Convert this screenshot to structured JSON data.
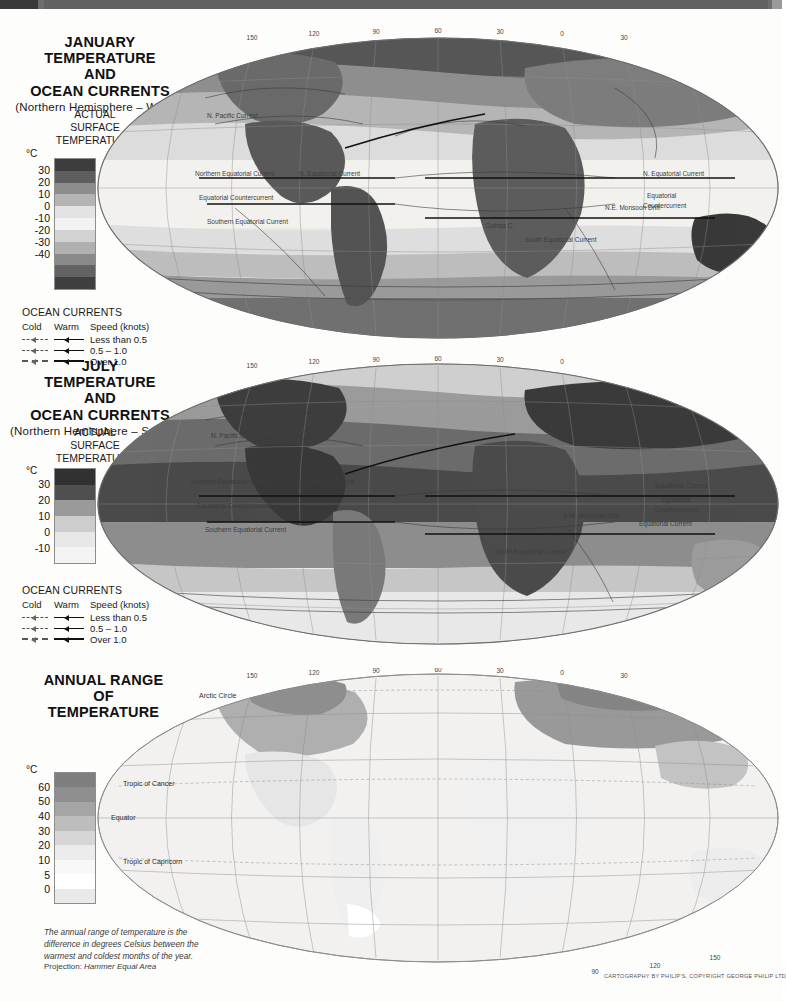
{
  "page": {
    "projection_label": "Projection:",
    "projection_value": "Hammer Equal Area",
    "credit": "CARTOGRAPHY BY PHILIP'S, COPYRIGHT GEORGE PHILIP LTD"
  },
  "maps": [
    {
      "id": "january",
      "title_lines": [
        "JANUARY",
        "TEMPERATURE",
        "AND",
        "OCEAN CURRENTS"
      ],
      "subtitle": "(Northern Hemisphere – Winter)",
      "legend_heading": [
        "ACTUAL",
        "SURFACE",
        "TEMPERATURE"
      ],
      "unit": "°C",
      "scale_values": [
        "30",
        "20",
        "10",
        "0",
        "-10",
        "-20",
        "-30",
        "-40"
      ],
      "swatch_colors": [
        "#3d3d3d",
        "#5e5e5e",
        "#8d8d8d",
        "#b4b4b4",
        "#e3e3e3",
        "#f2f2f2",
        "#d2d2d2",
        "#b0b0b0",
        "#8a8a8a",
        "#636363",
        "#3f3f3f"
      ],
      "currents_key": {
        "title": "OCEAN CURRENTS",
        "columns": [
          "Cold",
          "Warm",
          "Speed (knots)"
        ],
        "rows": [
          "Less than 0.5",
          "0.5 – 1.0",
          "Over 1.0"
        ]
      },
      "current_labels": [
        "N. Pacific Current",
        "N. Atlantic Drift",
        "West Wind Drift",
        "Oya Siwo",
        "Kuro Siwo",
        "Northern Equatorial Current",
        "N. Equatorial Current",
        "Equatorial Countercurrent",
        "Southern Equatorial Current",
        "Guinea C.",
        "N.E. Monsoon Drift",
        "Peru (Humboldt) Current",
        "Brazil Current",
        "Benguela Current",
        "South Equatorial Current",
        "Antarctic Circumpolar Current"
      ],
      "graticule_top": [
        "150",
        "120",
        "90",
        "60",
        "30",
        "0",
        "30",
        "60",
        "90",
        "120",
        "150"
      ],
      "graticule_left": [
        "60",
        "30",
        "0",
        "30",
        "60"
      ]
    },
    {
      "id": "july",
      "title_lines": [
        "JULY",
        "TEMPERATURE",
        "AND",
        "OCEAN CURRENTS"
      ],
      "subtitle": "(Northern Hemisphere – Summer)",
      "legend_heading": [
        "ACTUAL",
        "SURFACE",
        "TEMPERATURE"
      ],
      "unit": "°C",
      "scale_values": [
        "30",
        "20",
        "10",
        "0",
        "-10"
      ],
      "swatch_colors": [
        "#313131",
        "#4f4f4f",
        "#9a9a9a",
        "#cdcdcd",
        "#e8e8e8",
        "#f4f4f4"
      ],
      "currents_key": {
        "title": "OCEAN CURRENTS",
        "columns": [
          "Cold",
          "Warm",
          "Speed (knots)"
        ],
        "rows": [
          "Less than 0.5",
          "0.5 – 1.0",
          "Over 1.0"
        ]
      },
      "current_labels": [
        "N. Pacific Current",
        "North Atlantic Drift",
        "Labrador C.",
        "Gulf Stream",
        "Oya Siwo",
        "Northern Equatorial Current",
        "N. Equatorial Current",
        "Equatorial Countercurrent",
        "Equatorial Current",
        "S. Equatorial Current",
        "Southern Equatorial Current",
        "South Equatorial Current",
        "Guinea C.",
        "S.W. Monsoon Drift",
        "Peru (Humboldt) Current",
        "Brazil Current",
        "Benguela Current",
        "Agulhas C.",
        "Antarctic Circumpolar Current"
      ],
      "graticule_top": [
        "150",
        "120",
        "90",
        "60",
        "30",
        "0",
        "30",
        "60",
        "90",
        "120",
        "150"
      ],
      "graticule_left": [
        "60",
        "30",
        "0",
        "30",
        "60"
      ]
    },
    {
      "id": "annual-range",
      "title_lines": [
        "ANNUAL RANGE",
        "OF",
        "TEMPERATURE"
      ],
      "subtitle": "",
      "unit": "°C",
      "scale_values": [
        "60",
        "50",
        "40",
        "30",
        "20",
        "10",
        "5",
        "0"
      ],
      "swatch_colors": [
        "#7e7e7e",
        "#8f8f8f",
        "#a5a5a5",
        "#bdbdbd",
        "#d6d6d6",
        "#ececec",
        "#f8f8f8",
        "#ffffff",
        "#e9e9e9"
      ],
      "note": "The annual range of temperature is the difference in degrees Celsius between the warmest and coldest months of the year.",
      "map_labels": [
        "Arctic Circle",
        "Tropic of Cancer",
        "Equator",
        "Tropic of Capricorn"
      ],
      "graticule_top": [
        "150",
        "120",
        "90",
        "60",
        "30",
        "0",
        "30",
        "60",
        "90",
        "120",
        "150"
      ],
      "graticule_left": [
        "60",
        "30",
        "0",
        "30",
        "60"
      ],
      "graticule_bottom": [
        "90",
        "120",
        "150"
      ]
    }
  ]
}
